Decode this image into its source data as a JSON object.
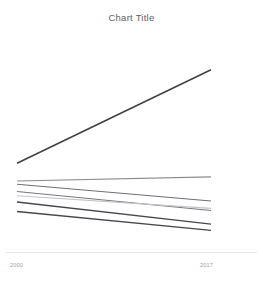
{
  "window": {
    "clipped_top_text": "",
    "background_color": "#ffffff"
  },
  "chart": {
    "title": "Chart Title",
    "axis_line_color": "#e2e2e6",
    "tick_label_color": "#9a9aa2"
  },
  "xaxis": {
    "start_label": "2000",
    "end_label": "2017"
  },
  "chart_data": {
    "type": "line",
    "title": "Chart Title",
    "subtitle": "",
    "xlabel": "",
    "ylabel": "",
    "x": [
      2000,
      2017
    ],
    "xlim": [
      2000,
      2017
    ],
    "ylim": [
      0,
      100
    ],
    "grid": false,
    "legend": "none",
    "tick_labels": {
      "x": [
        "2000",
        "2017"
      ],
      "y": []
    },
    "annotations": [],
    "series": [
      {
        "name": "Series 1",
        "values": [
          38.0,
          82.5
        ],
        "color": "#3f3f45",
        "width": 1.5,
        "trend": "rising-steep"
      },
      {
        "name": "Series 2",
        "values": [
          29.5,
          31.5
        ],
        "color": "#8b8b92",
        "width": 1.1,
        "trend": "rising-slight"
      },
      {
        "name": "Series 3",
        "values": [
          28.0,
          20.0
        ],
        "color": "#6e6e76",
        "width": 1.1,
        "trend": "falling"
      },
      {
        "name": "Series 4",
        "values": [
          24.5,
          15.5
        ],
        "color": "#77777f",
        "width": 1.1,
        "trend": "falling"
      },
      {
        "name": "Series 5",
        "values": [
          22.5,
          16.5
        ],
        "color": "#c2c2c8",
        "width": 1.1,
        "trend": "falling-light"
      },
      {
        "name": "Series 6",
        "values": [
          19.5,
          9.0
        ],
        "color": "#46464d",
        "width": 1.4,
        "trend": "falling"
      },
      {
        "name": "Series 7",
        "values": [
          15.0,
          6.0
        ],
        "color": "#46464d",
        "width": 1.4,
        "trend": "falling"
      }
    ]
  }
}
